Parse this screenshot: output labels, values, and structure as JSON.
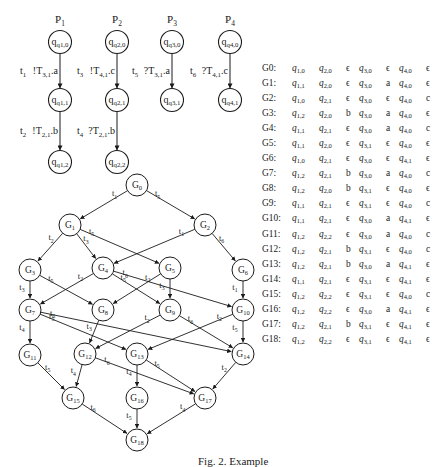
{
  "processes": [
    {
      "label": "P",
      "index": "1",
      "states": [
        "q1,0",
        "q1,1",
        "q1,2"
      ],
      "transitions": [
        {
          "id": "t1",
          "action": "!T",
          "chan": "3,1",
          "msg": "a"
        },
        {
          "id": "t2",
          "action": "!T",
          "chan": "2,1",
          "msg": "b"
        }
      ]
    },
    {
      "label": "P",
      "index": "2",
      "states": [
        "q2,0",
        "q2,1",
        "q2,2"
      ],
      "transitions": [
        {
          "id": "t3",
          "action": "!T",
          "chan": "4,1",
          "msg": "c"
        },
        {
          "id": "t4",
          "action": "?T",
          "chan": "2,1",
          "msg": "b"
        }
      ]
    },
    {
      "label": "P",
      "index": "3",
      "states": [
        "q3,0",
        "q3,1"
      ],
      "transitions": [
        {
          "id": "t5",
          "action": "?T",
          "chan": "3,1",
          "msg": "a"
        }
      ]
    },
    {
      "label": "P",
      "index": "4",
      "states": [
        "q4,0",
        "q4,1"
      ],
      "transitions": [
        {
          "id": "t6",
          "action": "?T",
          "chan": "4,1",
          "msg": "c"
        }
      ]
    }
  ],
  "graph": {
    "nodes": [
      "G0",
      "G1",
      "G2",
      "G3",
      "G4",
      "G5",
      "G6",
      "G7",
      "G8",
      "G9",
      "G10",
      "G11",
      "G12",
      "G13",
      "G14",
      "G15",
      "G16",
      "G17",
      "G18"
    ],
    "edges": [
      {
        "from": "G0",
        "to": "G1",
        "label": "t1"
      },
      {
        "from": "G0",
        "to": "G2",
        "label": "t5"
      },
      {
        "from": "G1",
        "to": "G3",
        "label": "t2"
      },
      {
        "from": "G1",
        "to": "G4",
        "label": "t3"
      },
      {
        "from": "G1",
        "to": "G5",
        "label": "t5"
      },
      {
        "from": "G2",
        "to": "G4",
        "label": "t1"
      },
      {
        "from": "G2",
        "to": "G6",
        "label": "t6"
      },
      {
        "from": "G3",
        "to": "G7",
        "label": "t3"
      },
      {
        "from": "G3",
        "to": "G8",
        "label": "t5"
      },
      {
        "from": "G4",
        "to": "G7",
        "label": "t2"
      },
      {
        "from": "G4",
        "to": "G9",
        "label": "t5"
      },
      {
        "from": "G4",
        "to": "G10",
        "label": "t6"
      },
      {
        "from": "G5",
        "to": "G8",
        "label": "t2"
      },
      {
        "from": "G5",
        "to": "G9",
        "label": "t3"
      },
      {
        "from": "G6",
        "to": "G10",
        "label": "t1"
      },
      {
        "from": "G7",
        "to": "G11",
        "label": "t4"
      },
      {
        "from": "G7",
        "to": "G13",
        "label": "t5"
      },
      {
        "from": "G7",
        "to": "G14",
        "label": "t6"
      },
      {
        "from": "G8",
        "to": "G12",
        "label": "t3"
      },
      {
        "from": "G9",
        "to": "G12",
        "label": "t2"
      },
      {
        "from": "G9",
        "to": "G14",
        "label": "t6"
      },
      {
        "from": "G10",
        "to": "G13",
        "label": "t2"
      },
      {
        "from": "G10",
        "to": "G14",
        "label": "t5"
      },
      {
        "from": "G11",
        "to": "G15",
        "label": "t5"
      },
      {
        "from": "G12",
        "to": "G15",
        "label": "t4"
      },
      {
        "from": "G12",
        "to": "G17",
        "label": "t6"
      },
      {
        "from": "G13",
        "to": "G16",
        "label": "t4"
      },
      {
        "from": "G13",
        "to": "G17",
        "label": "t5"
      },
      {
        "from": "G14",
        "to": "G17",
        "label": "t2"
      },
      {
        "from": "G15",
        "to": "G18",
        "label": "t6"
      },
      {
        "from": "G16",
        "to": "G18",
        "label": "t5"
      },
      {
        "from": "G17",
        "to": "G18",
        "label": "t4"
      }
    ]
  },
  "state_table": [
    {
      "g": "G0:",
      "q1": "1,0",
      "q2": "2,0",
      "c21": "ϵ",
      "q3": "3,0",
      "c31": "ϵ",
      "q4": "4,0",
      "c41": "ϵ"
    },
    {
      "g": "G1:",
      "q1": "1,1",
      "q2": "2,0",
      "c21": "ϵ",
      "q3": "3,0",
      "c31": "a",
      "q4": "4,0",
      "c41": "ϵ"
    },
    {
      "g": "G2:",
      "q1": "1,0",
      "q2": "2,1",
      "c21": "ϵ",
      "q3": "3,0",
      "c31": "ϵ",
      "q4": "4,0",
      "c41": "c"
    },
    {
      "g": "G3:",
      "q1": "1,2",
      "q2": "2,0",
      "c21": "b",
      "q3": "3,0",
      "c31": "a",
      "q4": "4,0",
      "c41": "ϵ"
    },
    {
      "g": "G4:",
      "q1": "1,1",
      "q2": "2,1",
      "c21": "ϵ",
      "q3": "3,0",
      "c31": "a",
      "q4": "4,0",
      "c41": "c"
    },
    {
      "g": "G5:",
      "q1": "1,1",
      "q2": "2,0",
      "c21": "ϵ",
      "q3": "3,1",
      "c31": "ϵ",
      "q4": "4,0",
      "c41": "ϵ"
    },
    {
      "g": "G6:",
      "q1": "1,0",
      "q2": "2,1",
      "c21": "ϵ",
      "q3": "3,0",
      "c31": "ϵ",
      "q4": "4,1",
      "c41": "ϵ"
    },
    {
      "g": "G7:",
      "q1": "1,2",
      "q2": "2,1",
      "c21": "b",
      "q3": "3,0",
      "c31": "a",
      "q4": "4,0",
      "c41": "c"
    },
    {
      "g": "G8:",
      "q1": "1,2",
      "q2": "2,0",
      "c21": "b",
      "q3": "3,1",
      "c31": "ϵ",
      "q4": "4,0",
      "c41": "ϵ"
    },
    {
      "g": "G9:",
      "q1": "1,1",
      "q2": "2,1",
      "c21": "ϵ",
      "q3": "3,1",
      "c31": "ϵ",
      "q4": "4,0",
      "c41": "c"
    },
    {
      "g": "G10:",
      "q1": "1,1",
      "q2": "2,1",
      "c21": "ϵ",
      "q3": "3,0",
      "c31": "a",
      "q4": "4,1",
      "c41": "ϵ"
    },
    {
      "g": "G11:",
      "q1": "1,2",
      "q2": "2,2",
      "c21": "ϵ",
      "q3": "3,0",
      "c31": "a",
      "q4": "4,0",
      "c41": "c"
    },
    {
      "g": "G12:",
      "q1": "1,2",
      "q2": "2,1",
      "c21": "b",
      "q3": "3,1",
      "c31": "ϵ",
      "q4": "4,0",
      "c41": "c"
    },
    {
      "g": "G13:",
      "q1": "1,2",
      "q2": "2,1",
      "c21": "b",
      "q3": "3,0",
      "c31": "a",
      "q4": "4,1",
      "c41": "ϵ"
    },
    {
      "g": "G14:",
      "q1": "1,1",
      "q2": "2,1",
      "c21": "ϵ",
      "q3": "3,1",
      "c31": "ϵ",
      "q4": "4,1",
      "c41": "ϵ"
    },
    {
      "g": "G15:",
      "q1": "1,2",
      "q2": "2,2",
      "c21": "ϵ",
      "q3": "3,1",
      "c31": "ϵ",
      "q4": "4,0",
      "c41": "c"
    },
    {
      "g": "G16:",
      "q1": "1,2",
      "q2": "2,2",
      "c21": "ϵ",
      "q3": "3,0",
      "c31": "a",
      "q4": "4,1",
      "c41": "ϵ"
    },
    {
      "g": "G17:",
      "q1": "1,2",
      "q2": "2,1",
      "c21": "b",
      "q3": "3,1",
      "c31": "ϵ",
      "q4": "4,1",
      "c41": "ϵ"
    },
    {
      "g": "G18:",
      "q1": "1,2",
      "q2": "2,2",
      "c21": "ϵ",
      "q3": "3,1",
      "c31": "ϵ",
      "q4": "4,1",
      "c41": "ϵ"
    }
  ],
  "caption": "Fig. 2. Example"
}
